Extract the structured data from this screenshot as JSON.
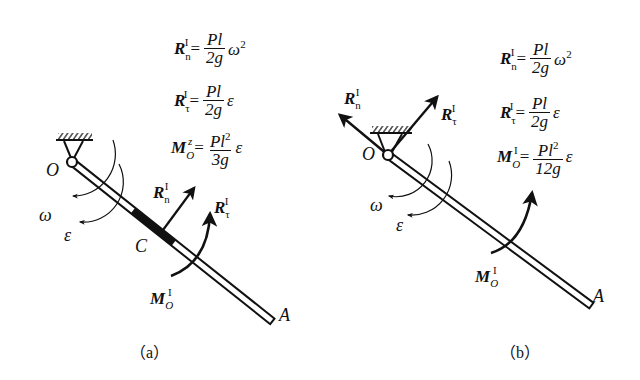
{
  "figure_a": {
    "caption": "（a）",
    "labels": {
      "pivot": "O",
      "center": "C",
      "end": "A",
      "omega": "ω",
      "epsilon": "ε"
    },
    "vector_labels": {
      "Rn": {
        "base": "R",
        "sub": "n",
        "sup": "I"
      },
      "Rt": {
        "base": "R",
        "sub": "τ",
        "sup": "I"
      },
      "MO": {
        "base": "M",
        "sub": "O",
        "sup": "I"
      }
    },
    "equations": [
      {
        "lhs_base": "R",
        "lhs_sub": "n",
        "lhs_sup": "I",
        "equals": "=",
        "num": "Pl",
        "num_sup": "",
        "den": "2g",
        "tail": "ω",
        "tail_sup": "2"
      },
      {
        "lhs_base": "R",
        "lhs_sub": "τ",
        "lhs_sup": "I",
        "equals": "=",
        "num": "Pl",
        "num_sup": "",
        "den": "2g",
        "tail": "ε",
        "tail_sup": ""
      },
      {
        "lhs_base": "M",
        "lhs_sub": "O",
        "lhs_sup": "z",
        "equals": "=",
        "num": "Pl",
        "num_sup": "2",
        "den": "3g",
        "tail": "ε",
        "tail_sup": ""
      }
    ]
  },
  "figure_b": {
    "caption": "（b）",
    "labels": {
      "pivot": "O",
      "end": "A",
      "omega": "ω",
      "epsilon": "ε"
    },
    "vector_labels": {
      "Rn": {
        "base": "R",
        "sub": "n",
        "sup": "I"
      },
      "Rt": {
        "base": "R",
        "sub": "τ",
        "sup": "I"
      },
      "MO": {
        "base": "M",
        "sub": "O",
        "sup": "I"
      }
    },
    "equations": [
      {
        "lhs_base": "R",
        "lhs_sub": "n",
        "lhs_sup": "I",
        "equals": "=",
        "num": "Pl",
        "num_sup": "",
        "den": "2g",
        "tail": "ω",
        "tail_sup": "2"
      },
      {
        "lhs_base": "R",
        "lhs_sub": "τ",
        "lhs_sup": "I",
        "equals": "=",
        "num": "Pl",
        "num_sup": "",
        "den": "2g",
        "tail": "ε",
        "tail_sup": ""
      },
      {
        "lhs_base": "M",
        "lhs_sub": "O",
        "lhs_sup": "I",
        "equals": "=",
        "num": "Pl",
        "num_sup": "2",
        "den": "12g",
        "tail": "ε",
        "tail_sup": ""
      }
    ]
  }
}
